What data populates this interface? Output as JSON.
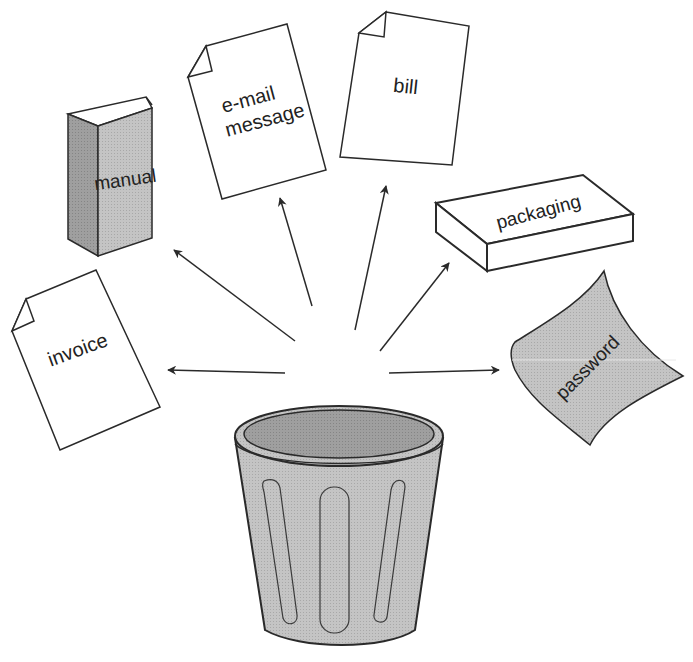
{
  "diagram": {
    "source": {
      "label": "",
      "icon": "trash-can-icon"
    },
    "items": [
      {
        "id": "manual",
        "label": "manual",
        "icon": "book-icon"
      },
      {
        "id": "email",
        "label_line1": "e-mail",
        "label_line2": "message",
        "icon": "document-icon"
      },
      {
        "id": "bill",
        "label": "bill",
        "icon": "document-icon"
      },
      {
        "id": "packaging",
        "label": "packaging",
        "icon": "box-icon"
      },
      {
        "id": "invoice",
        "label": "invoice",
        "icon": "document-icon"
      },
      {
        "id": "password",
        "label": "password",
        "icon": "curled-paper-icon"
      }
    ],
    "colors": {
      "stroke": "#2a2a2a",
      "gray_fill": "#bdbdbd",
      "dark_gray_fill": "#9a9a9a",
      "paper": "#ffffff"
    }
  }
}
